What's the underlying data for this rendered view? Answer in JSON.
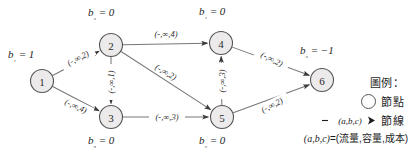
{
  "figure": {
    "type": "network-flow-diagram",
    "nodes": [
      {
        "id": "1",
        "label": "1",
        "x": 42,
        "y": 81,
        "supply_text": "b₁ = 1",
        "supply_value": 1,
        "b_x": 8,
        "b_y": 48
      },
      {
        "id": "2",
        "label": "2",
        "x": 111,
        "y": 45,
        "supply_text": "b₂ = 0",
        "supply_value": 0,
        "b_x": 88,
        "b_y": 6
      },
      {
        "id": "3",
        "label": "3",
        "x": 111,
        "y": 117,
        "supply_text": "b₃ = 0",
        "supply_value": 0,
        "b_x": 88,
        "b_y": 134
      },
      {
        "id": "4",
        "label": "4",
        "x": 221,
        "y": 43,
        "supply_text": "b₄ = 0",
        "supply_value": 0,
        "b_x": 199,
        "b_y": 5
      },
      {
        "id": "5",
        "label": "5",
        "x": 222,
        "y": 117,
        "supply_text": "b₅ = 0",
        "supply_value": 0,
        "b_x": 199,
        "b_y": 134
      },
      {
        "id": "6",
        "label": "6",
        "x": 322,
        "y": 80,
        "supply_text": "b₆ = −1",
        "supply_value": -1,
        "b_x": 300,
        "b_y": 44
      }
    ],
    "edges": [
      {
        "from": "1",
        "to": "2",
        "label": "(-,∞,2)",
        "flow": "-",
        "capacity": "∞",
        "cost": 2,
        "lx": 78,
        "ly": 58,
        "rotate": -27
      },
      {
        "from": "1",
        "to": "3",
        "label": "(-,∞,4)",
        "flow": "-",
        "capacity": "∞",
        "cost": 4,
        "lx": 76,
        "ly": 106,
        "rotate": 25
      },
      {
        "from": "2",
        "to": "4",
        "label": "(-,∞,4)",
        "flow": "-",
        "capacity": "∞",
        "cost": 4,
        "lx": 166,
        "ly": 34,
        "rotate": 0
      },
      {
        "from": "2",
        "to": "3",
        "label": "(-,∞,1)",
        "flow": "-",
        "capacity": "∞",
        "cost": 1,
        "lx": 111,
        "ly": 82,
        "rotate": -90
      },
      {
        "from": "2",
        "to": "5",
        "label": "(-,∞,2)",
        "flow": "-",
        "capacity": "∞",
        "cost": 2,
        "lx": 166,
        "ly": 72,
        "rotate": 30
      },
      {
        "from": "3",
        "to": "5",
        "label": "(-,∞,3)",
        "flow": "-",
        "capacity": "∞",
        "cost": 3,
        "lx": 167,
        "ly": 117,
        "rotate": 0
      },
      {
        "from": "5",
        "to": "4",
        "label": "(-,∞,3)",
        "flow": "-",
        "capacity": "∞",
        "cost": 3,
        "lx": 222,
        "ly": 81,
        "rotate": -90
      },
      {
        "from": "4",
        "to": "6",
        "label": "(-,∞,2)",
        "flow": "-",
        "capacity": "∞",
        "cost": 2,
        "lx": 272,
        "ly": 59,
        "rotate": 27
      },
      {
        "from": "5",
        "to": "6",
        "label": "(-,∞,2)",
        "flow": "-",
        "capacity": "∞",
        "cost": 2,
        "lx": 272,
        "ly": 105,
        "rotate": -27
      }
    ]
  },
  "legend": {
    "title": "圖例：",
    "node_label": "節點",
    "arc_glyph_text": "(a,b,c)",
    "arc_label": "節線",
    "formula_prefix": "(a,b,c)",
    "formula_eq": "=(",
    "formula_terms": "流量,容量,成本)"
  },
  "colors": {
    "node_fill": "#eceaea",
    "node_stroke": "#555555",
    "edge_stroke": "#777777",
    "text": "#1d1d1d"
  }
}
